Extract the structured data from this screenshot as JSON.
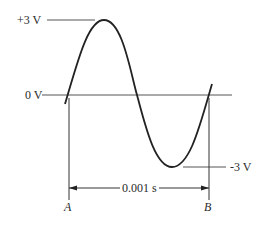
{
  "diagram": {
    "type": "sine-wave-period",
    "labels": {
      "positive_peak": "+3 V",
      "zero": "0 V",
      "negative_peak": "-3 V",
      "period": "0.001 s",
      "start_point": "A",
      "end_point": "B"
    },
    "values": {
      "amplitude_volts": 3,
      "period_seconds": 0.001
    },
    "colors": {
      "line": "#2a2a2a",
      "background": "#ffffff"
    }
  }
}
